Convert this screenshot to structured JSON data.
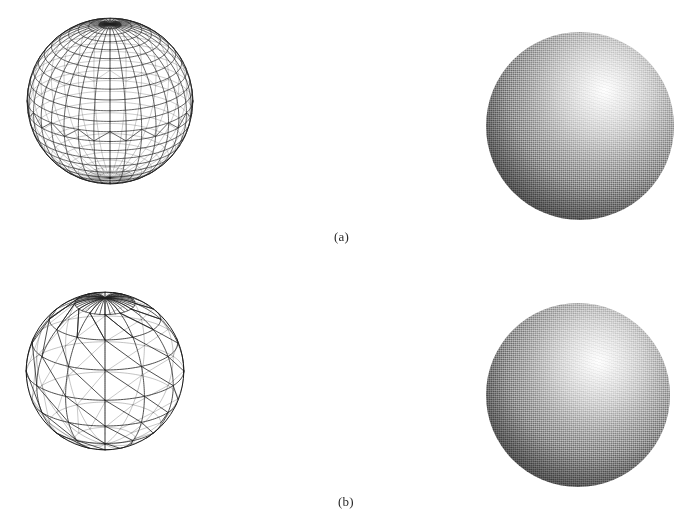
{
  "figure": {
    "type": "illustration-figure",
    "background_color": "#ffffff",
    "ink_color": "#222222",
    "width": 694,
    "height": 522,
    "captions": [
      {
        "id": "caption-a",
        "label": "(a)",
        "x": 334,
        "y": 229
      },
      {
        "id": "caption-b",
        "label": "(b)",
        "x": 338,
        "y": 494
      }
    ],
    "rows": [
      {
        "id": "row-a",
        "caption": "(a)",
        "wireframe": {
          "name": "fine-tessellated-wireframe-sphere",
          "x": 26,
          "y": 17,
          "size": 168,
          "meridians": 32,
          "parallels": 24,
          "pole_fan_lines": 36,
          "equator_band": true,
          "stroke_width": 0.7,
          "description": "UV sphere wireframe, fine tessellation"
        },
        "shaded": {
          "name": "fine-tessellated-shaded-sphere",
          "x": 486,
          "y": 32,
          "size": 188,
          "highlight_x_pct": 63,
          "highlight_y_pct": 31,
          "highlight_color": "#ffffff",
          "shadow_color": "#151515",
          "render_style": "halftone-dither",
          "description": "Gouraud shaded sphere rendered from fine mesh"
        }
      },
      {
        "id": "row-b",
        "caption": "(b)",
        "wireframe": {
          "name": "coarse-tessellated-wireframe-sphere",
          "x": 25,
          "y": 291,
          "size": 160,
          "meridians": 12,
          "parallels": 8,
          "pole_fan_lines": 36,
          "equator_band": false,
          "stroke_width": 0.8,
          "description": "Triangulated sphere wireframe, coarse tessellation"
        },
        "shaded": {
          "name": "coarse-tessellated-shaded-sphere",
          "x": 486,
          "y": 303,
          "size": 184,
          "highlight_x_pct": 61,
          "highlight_y_pct": 32,
          "highlight_color": "#ffffff",
          "shadow_color": "#171717",
          "render_style": "halftone-dither",
          "description": "Gouraud shaded sphere rendered from coarse mesh"
        }
      }
    ]
  }
}
